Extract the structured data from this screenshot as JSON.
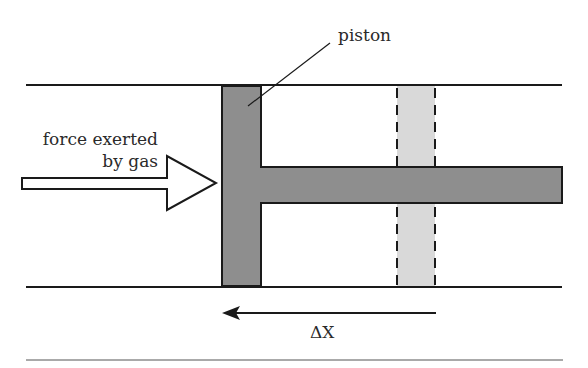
{
  "diagram": {
    "labels": {
      "piston": "piston",
      "force_line1": "force exerted",
      "force_line2": "by gas",
      "displacement": "ΔX"
    },
    "colors": {
      "piston_fill": "#8e8e8e",
      "ghost_piston_fill": "#d9d9d9",
      "stroke": "#1a1a1a",
      "arrow_fill": "#ffffff"
    }
  }
}
